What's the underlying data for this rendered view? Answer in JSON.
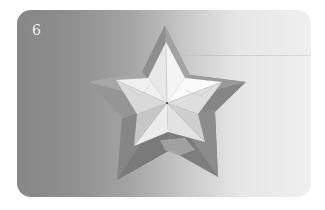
{
  "figure": {
    "step_number": "6",
    "colors": {
      "background_left": "#878787",
      "background_right": "#efefef",
      "outer_star": "#8f8f8f",
      "inner_star_light": "#f2f2f2",
      "inner_star_shade": "#c4c4c4",
      "step_number": "#f6f6f6"
    }
  }
}
